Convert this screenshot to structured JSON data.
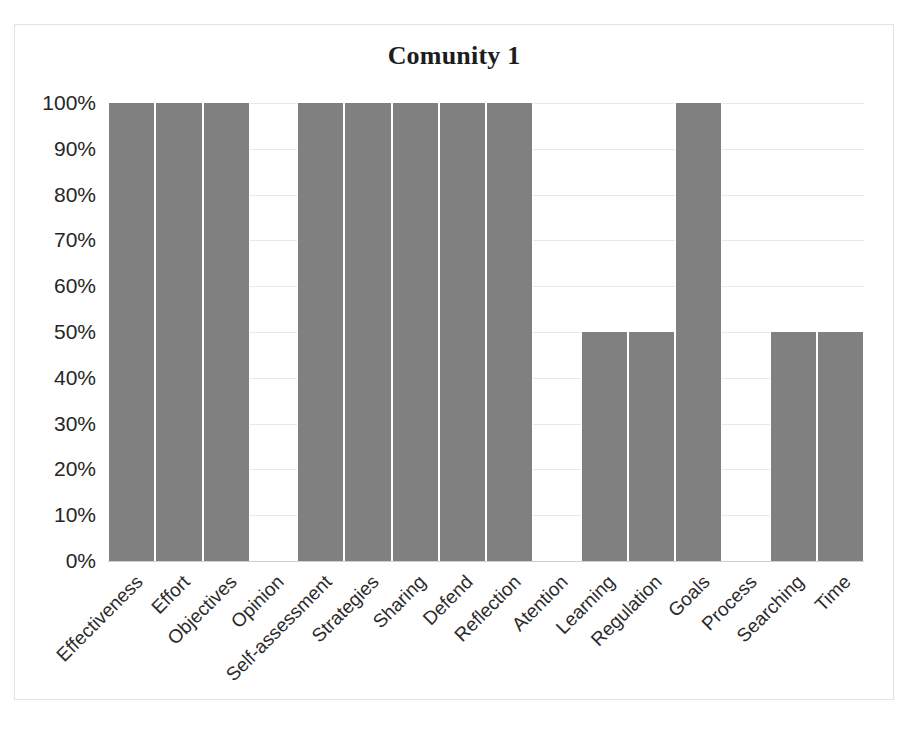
{
  "chart_data": {
    "type": "bar",
    "title": "Comunity 1",
    "xlabel": "",
    "ylabel": "",
    "ylim": [
      0,
      100
    ],
    "grid": true,
    "legend": false,
    "bar_color": "#808080",
    "categories": [
      "Effectiveness",
      "Effort",
      "Objectives",
      "Opinion",
      "Self-assessment",
      "Strategies",
      "Sharing",
      "Defend",
      "Reflection",
      "Atention",
      "Learning",
      "Regulation",
      "Goals",
      "Process",
      "Searching",
      "Time"
    ],
    "values": [
      100,
      100,
      100,
      0,
      100,
      100,
      100,
      100,
      100,
      0,
      50,
      50,
      100,
      0,
      50,
      50
    ],
    "y_ticks": [
      "0%",
      "10%",
      "20%",
      "30%",
      "40%",
      "50%",
      "60%",
      "70%",
      "80%",
      "90%",
      "100%"
    ],
    "y_tick_values": [
      0,
      10,
      20,
      30,
      40,
      50,
      60,
      70,
      80,
      90,
      100
    ]
  }
}
